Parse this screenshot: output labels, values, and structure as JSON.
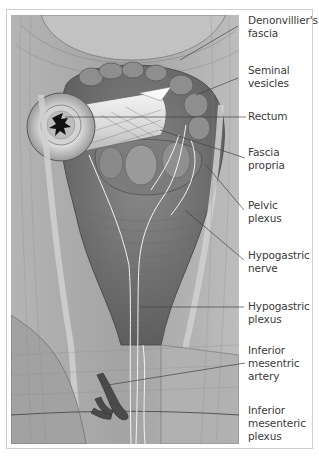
{
  "figure": {
    "labels": [
      {
        "id": "denonvillier",
        "text": "Denonvillier's\nfascia",
        "top": 14,
        "line": {
          "x1": 238,
          "y1": 26,
          "x2": 180,
          "y2": 60
        }
      },
      {
        "id": "seminal",
        "text": "Seminal\nvesicles",
        "top": 64,
        "line": {
          "x1": 238,
          "y1": 78,
          "x2": 196,
          "y2": 95
        }
      },
      {
        "id": "rectum",
        "text": "Rectum",
        "top": 110,
        "line": {
          "x1": 246,
          "y1": 117,
          "x2": 65,
          "y2": 117
        }
      },
      {
        "id": "fascia-propria",
        "text": "Fascia\npropria",
        "top": 146,
        "line": {
          "x1": 245,
          "y1": 158,
          "x2": 160,
          "y2": 130
        }
      },
      {
        "id": "pelvic-plexus",
        "text": "Pelvic\nplexus",
        "top": 199,
        "line": {
          "x1": 244,
          "y1": 210,
          "x2": 205,
          "y2": 164
        }
      },
      {
        "id": "hypogastric-nerve",
        "text": "Hypogastric\nnerve",
        "top": 249,
        "line": {
          "x1": 244,
          "y1": 260,
          "x2": 185,
          "y2": 210
        }
      },
      {
        "id": "hypogastric-plexus",
        "text": "Hypogastric\nplexus",
        "top": 300,
        "line": {
          "x1": 244,
          "y1": 307,
          "x2": 140,
          "y2": 307
        }
      },
      {
        "id": "ima",
        "text": "Inferior\nmesentric\nartery",
        "top": 344,
        "line": {
          "x1": 245,
          "y1": 363,
          "x2": 108,
          "y2": 385
        }
      },
      {
        "id": "imp",
        "text": "Inferior\nmesenteric\nplexus",
        "top": 404,
        "line": null
      }
    ]
  },
  "colors": {
    "frame_border": "#cfcfcf",
    "label_text": "#3a3a3a",
    "tissue_dark": "#6f6f6f",
    "tissue_mid": "#9c9c9c",
    "tissue_light": "#c8c8c8",
    "nerve": "#f2f2f2",
    "artery": "#4a4a4a"
  }
}
